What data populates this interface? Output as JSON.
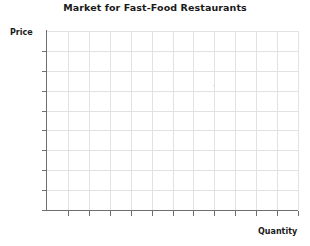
{
  "chart_data": {
    "type": "line",
    "title": "Market for Fast-Food Restaurants",
    "xlabel": "Quantity",
    "ylabel": "Price",
    "series": [],
    "x": [],
    "values": [],
    "grid": true,
    "legend": "none",
    "xlim": [
      0,
      12
    ],
    "ylim": [
      0,
      9
    ],
    "x_tick_labels": [],
    "y_tick_labels": [],
    "x_tick_count": 12,
    "y_tick_count": 9,
    "annotations": [],
    "note": "Empty grid template with no plotted data"
  },
  "chart": {
    "title": "Market for Fast-Food Restaurants",
    "y_axis_label": "Price",
    "x_axis_label": "Quantity"
  },
  "colors": {
    "axis": "#6f6f6f",
    "grid": "#e2e2e2",
    "text": "#1a1a1a",
    "background": "#ffffff"
  }
}
